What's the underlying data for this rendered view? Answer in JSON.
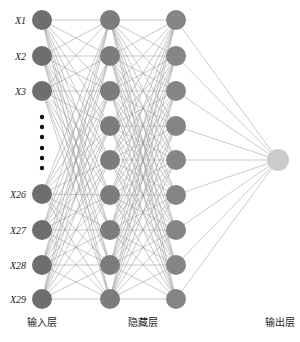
{
  "diagram": {
    "type": "neural-network",
    "layers": [
      {
        "name": "input",
        "label": "输入层",
        "x": 42,
        "label_x": 42,
        "node_color": "#6e6e6e",
        "nodes": [
          {
            "label": "X1",
            "y": 20
          },
          {
            "label": "X2",
            "y": 56
          },
          {
            "label": "X3",
            "y": 91
          },
          {
            "label": "X26",
            "y": 194
          },
          {
            "label": "X27",
            "y": 230
          },
          {
            "label": "X28",
            "y": 265
          },
          {
            "label": "X29",
            "y": 299
          }
        ],
        "ellipsis_dots_y": [
          117,
          127,
          137,
          148,
          158,
          168
        ]
      },
      {
        "name": "hidden-1",
        "label": "",
        "x": 110,
        "node_color": "#7c7c7c",
        "nodes": [
          {
            "y": 20
          },
          {
            "y": 56
          },
          {
            "y": 91
          },
          {
            "y": 126
          },
          {
            "y": 160
          },
          {
            "y": 195
          },
          {
            "y": 230
          },
          {
            "y": 265
          },
          {
            "y": 299
          }
        ]
      },
      {
        "name": "hidden-2",
        "label": "",
        "x": 176,
        "node_color": "#858585",
        "nodes": [
          {
            "y": 20
          },
          {
            "y": 56
          },
          {
            "y": 91
          },
          {
            "y": 126
          },
          {
            "y": 160
          },
          {
            "y": 195
          },
          {
            "y": 230
          },
          {
            "y": 265
          },
          {
            "y": 299
          }
        ]
      },
      {
        "name": "output",
        "label": "输出层",
        "x": 278,
        "label_x": 280,
        "node_color": "#cbcbcb",
        "nodes": [
          {
            "y": 160
          }
        ]
      }
    ],
    "hidden_label": "隐藏层",
    "hidden_label_x": 143,
    "layer_label_y": 326,
    "node_radius": 10,
    "edge_color": "#9a9a9a",
    "output_edge_color": "#b5b5b5"
  }
}
